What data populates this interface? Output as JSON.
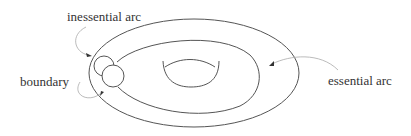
{
  "diagram": {
    "type": "surface-arcs",
    "labels": {
      "inessential_arc": "inessential arc",
      "boundary": "boundary",
      "essential_arc": "essential arc"
    },
    "colors": {
      "line": "#555555",
      "leader": "#aaaaaa",
      "text": "#333333",
      "background": "#ffffff"
    }
  }
}
